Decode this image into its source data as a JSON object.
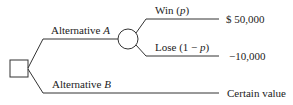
{
  "diagram": {
    "type": "decision-tree",
    "decision_node": "square",
    "chance_node": "circle",
    "branches": {
      "alt_a": {
        "label": "Alternative ",
        "var": "A"
      },
      "alt_b": {
        "label": "Alternative ",
        "var": "B"
      },
      "win": {
        "label": "Win (",
        "var": "p",
        "close": ")",
        "payoff": "$ 50,000"
      },
      "lose": {
        "label": "Lose (1 − ",
        "var": "p",
        "close": ")",
        "payoff": "−10,000"
      },
      "certain": {
        "payoff": "Certain value"
      }
    }
  }
}
